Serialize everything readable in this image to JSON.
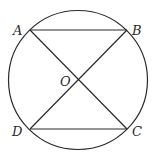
{
  "diagram": {
    "type": "circle-with-inscribed-chords",
    "circle": {
      "cx": 78,
      "cy": 80,
      "r": 69.5
    },
    "points": {
      "A": {
        "label": "A",
        "x": 30,
        "y": 30,
        "lx": 13,
        "ly": 35
      },
      "B": {
        "label": "B",
        "x": 127,
        "y": 30,
        "lx": 132,
        "ly": 35
      },
      "C": {
        "label": "C",
        "x": 127,
        "y": 129,
        "lx": 132,
        "ly": 136
      },
      "D": {
        "label": "D",
        "x": 30,
        "y": 129,
        "lx": 12,
        "ly": 136
      },
      "O": {
        "label": "O",
        "x": 78,
        "y": 80,
        "lx": 60,
        "ly": 86
      }
    },
    "segments": [
      [
        "A",
        "B"
      ],
      [
        "D",
        "C"
      ],
      [
        "A",
        "C"
      ],
      [
        "B",
        "D"
      ]
    ],
    "colors": {
      "stroke": "#2a2a2a",
      "background": "#ffffff"
    }
  }
}
